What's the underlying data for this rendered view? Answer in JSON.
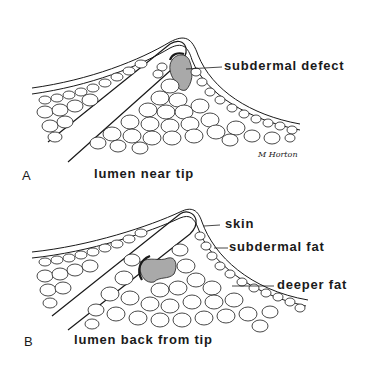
{
  "panels": [
    {
      "letter": "A",
      "caption": "lumen near tip",
      "labels": {
        "defect": "subdermal defect"
      },
      "signature": "M Horton"
    },
    {
      "letter": "B",
      "caption": "lumen back from tip",
      "labels": {
        "skin": "skin",
        "subdermal_fat": "subdermal fat",
        "deeper_fat": "deeper fat"
      }
    }
  ],
  "colors": {
    "line": "#1a1a1a",
    "defect_fill": "#a9a9a9",
    "background": "#ffffff"
  }
}
